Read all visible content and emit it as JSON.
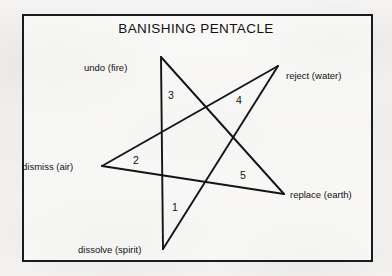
{
  "figure": {
    "title": "BANISHING PENTACLE",
    "frame": {
      "border_color": "#1b1b1b",
      "background": "#fdfdfc"
    },
    "stroke_color": "#141414",
    "background_color": "#f2f1ef"
  },
  "vertices": [
    {
      "id": "fire",
      "label": "undo (fire)",
      "x": 161,
      "y": 57,
      "label_x": 84,
      "label_y": 63
    },
    {
      "id": "water",
      "label": "reject (water)",
      "x": 278,
      "y": 66,
      "label_x": 286,
      "label_y": 71
    },
    {
      "id": "air",
      "label": "dismiss (air)",
      "x": 102,
      "y": 166,
      "label_x": 22,
      "label_y": 162
    },
    {
      "id": "earth",
      "label": "replace (earth)",
      "x": 284,
      "y": 194,
      "label_x": 290,
      "label_y": 190
    },
    {
      "id": "spirit",
      "label": "dissolve (spirit)",
      "x": 163,
      "y": 249,
      "label_x": 78,
      "label_y": 245
    }
  ],
  "segments": [
    {
      "number": "1",
      "from": "spirit",
      "to": "water",
      "num_x": 172,
      "num_y": 202
    },
    {
      "number": "2",
      "from": "air",
      "to": "water",
      "num_x": 133,
      "num_y": 155
    },
    {
      "number": "3",
      "from": "fire",
      "to": "spirit",
      "num_x": 168,
      "num_y": 90
    },
    {
      "number": "4",
      "from": "fire",
      "to": "earth",
      "num_x": 236,
      "num_y": 95
    },
    {
      "number": "5",
      "from": "earth",
      "to": "air",
      "num_x": 240,
      "num_y": 170
    }
  ]
}
